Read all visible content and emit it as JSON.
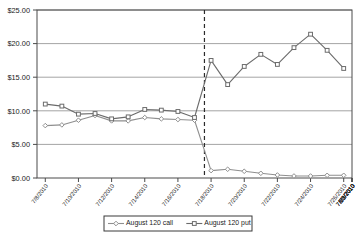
{
  "chart_data": {
    "type": "line",
    "title": "",
    "xlabel": "",
    "ylabel": "",
    "ylim": [
      0,
      25
    ],
    "ytick_labels": [
      "$0.00",
      "$5.00",
      "$10.00",
      "$15.00",
      "$20.00",
      "$25.00"
    ],
    "ytick_values": [
      0,
      5,
      10,
      15,
      20,
      25
    ],
    "grid": true,
    "legend_position": "bottom",
    "x": [
      "7/8/2010",
      "7/9/2010",
      "7/12/2010",
      "7/13/2010",
      "7/14/2010",
      "7/15/2010",
      "7/16/2010",
      "7/19/2010",
      "7/20/2010",
      "7/21/2010",
      "7/22/2010",
      "7/23/2010",
      "7/26/2010",
      "7/27/2010",
      "7/28/2010",
      "7/29/2010",
      "7/30/2010",
      "8/2/2010",
      "8/3/2010"
    ],
    "xtick_labels": [
      "7/8/2010",
      "7/10/2010",
      "7/12/2010",
      "7/14/2010",
      "7/16/2010",
      "7/18/2010",
      "7/20/2010",
      "7/22/2010",
      "7/24/2010",
      "7/26/2010",
      "7/28/2010",
      "7/30/2010",
      "8/1/2010",
      "8/3/2010"
    ],
    "series": [
      {
        "name": "August 120 call",
        "marker": "diamond",
        "color": "#8f8f8f",
        "values": [
          7.8,
          7.9,
          8.6,
          9.3,
          8.5,
          8.5,
          9.0,
          8.8,
          8.7,
          8.6,
          1.1,
          1.3,
          1.0,
          0.7,
          0.45,
          0.3,
          0.3,
          0.4,
          0.4
        ]
      },
      {
        "name": "August 120 put",
        "marker": "square",
        "color": "#6b6b6b",
        "values": [
          11.0,
          10.7,
          9.5,
          9.6,
          8.8,
          9.1,
          10.2,
          10.1,
          9.9,
          9.0,
          17.5,
          13.9,
          16.6,
          18.4,
          16.9,
          19.4,
          21.4,
          19.0,
          16.3
        ]
      }
    ],
    "annotations": [
      {
        "type": "vertical-dashed-line",
        "x_index": 9.6,
        "label": ""
      }
    ]
  },
  "legend": {
    "items": [
      {
        "label": "August 120 call"
      },
      {
        "label": "August 120 put"
      }
    ]
  }
}
